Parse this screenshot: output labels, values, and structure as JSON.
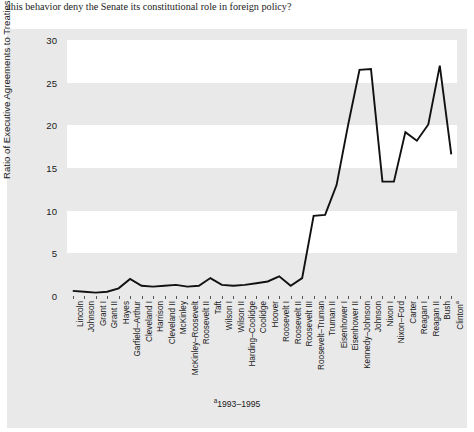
{
  "caption": "this behavior deny the Senate its constitutional role in foreign policy?",
  "footnote_marker": "a",
  "footnote_text": "1993–1995",
  "colors": {
    "figure_background": "#e9e9e9",
    "band": "#ffffff",
    "line": "#111111",
    "text": "#1a1a1a"
  },
  "chart_data": {
    "type": "line",
    "title": "",
    "xlabel": "",
    "ylabel": "Ratio of Executive Agreements to Treaties",
    "ylim": [
      0,
      30
    ],
    "yticks": [
      0,
      5,
      10,
      15,
      20,
      25,
      30
    ],
    "grid": false,
    "banded_background": true,
    "legend": null,
    "categories": [
      "Lincoln",
      "Johnson",
      "Grant I",
      "Grant II",
      "Hayes",
      "Garfield–Arthur",
      "Cleveland I",
      "Harrison",
      "Cleveland II",
      "McKinley",
      "McKinley–Roosevelt",
      "Roosevelt II",
      "Taft",
      "Wilson I",
      "Wilson II",
      "Harding–Coolidge",
      "Coolidge",
      "Hoover",
      "Roosevelt I",
      "Roosevelt II",
      "Roosevelt III",
      "Roosevelt–Truman",
      "Truman II",
      "Eisenhower I",
      "Eisenhower II",
      "Kennedy–Johnson",
      "Johnson",
      "Nixon I",
      "Nixon–Ford",
      "Carter",
      "Reagan I",
      "Reagan II",
      "Bush",
      "Clinton"
    ],
    "category_superscripts": {
      "33": "a"
    },
    "values": [
      0.6,
      0.5,
      0.4,
      0.5,
      0.9,
      2.0,
      1.2,
      1.1,
      1.2,
      1.3,
      1.1,
      1.2,
      2.1,
      1.3,
      1.2,
      1.3,
      1.5,
      1.7,
      2.3,
      1.2,
      2.1,
      9.4,
      9.5,
      13.0,
      20.0,
      26.5,
      26.6,
      13.4,
      13.4,
      19.2,
      18.2,
      20.1,
      27.0,
      16.6
    ]
  }
}
